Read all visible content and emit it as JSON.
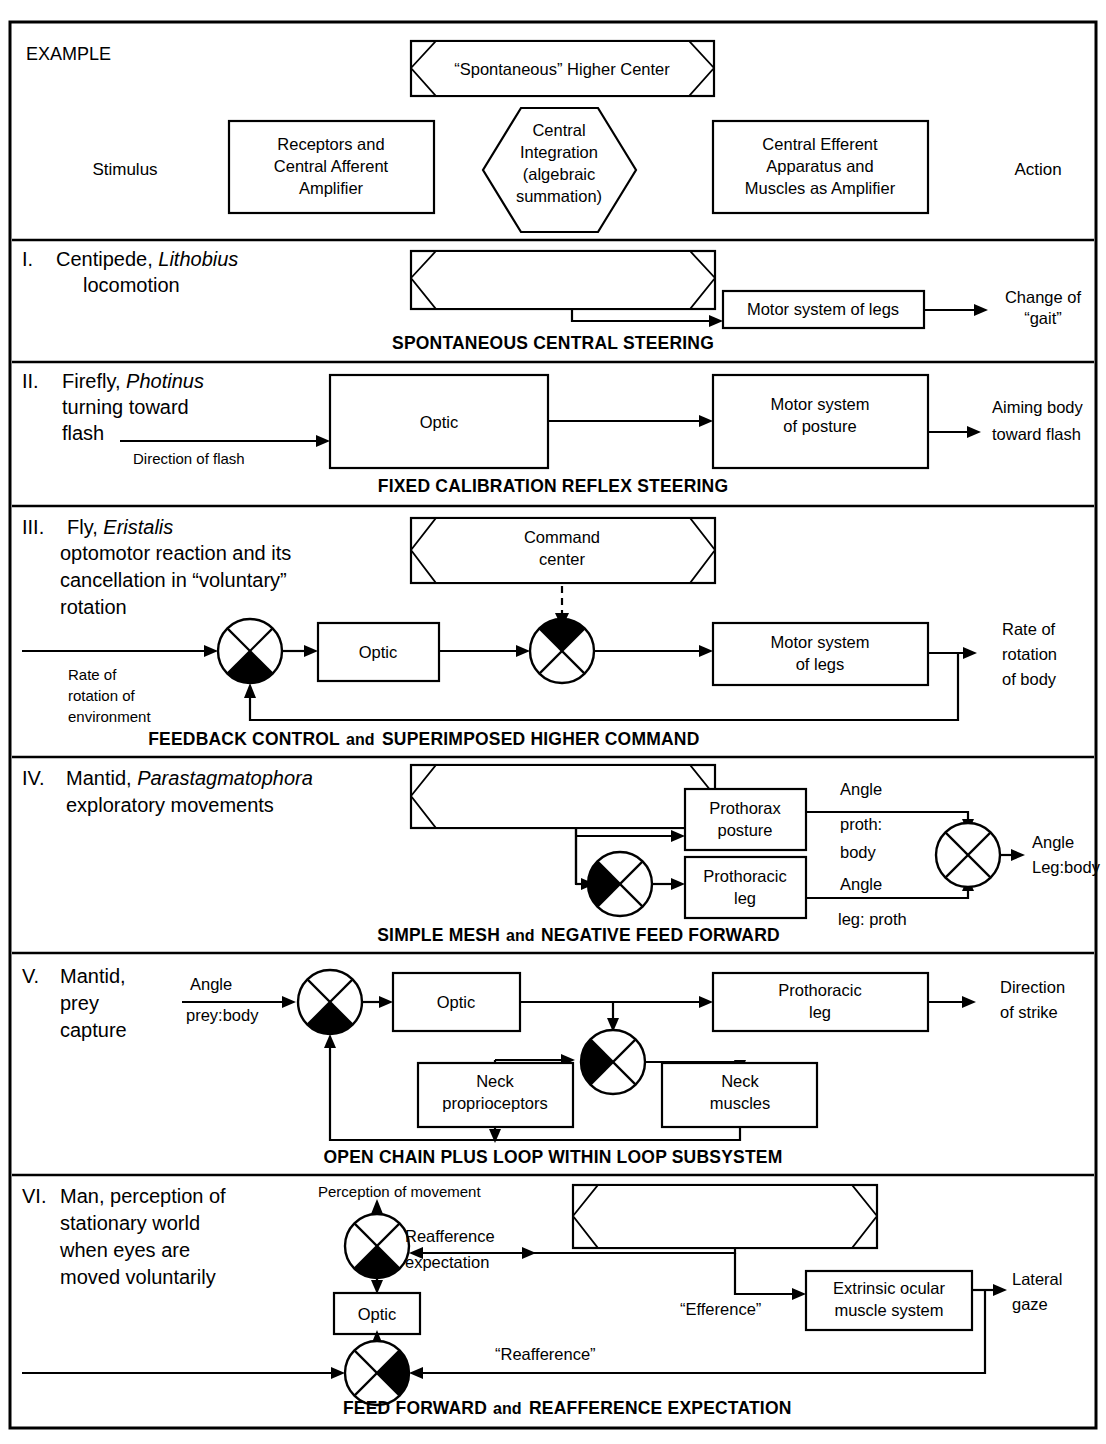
{
  "figure": {
    "header": {
      "example_label": "EXAMPLE",
      "spontaneous_box": "“Spontaneous” Higher Center",
      "stimulus_label": "Stimulus",
      "action_label": "Action",
      "receptors_box": [
        "Receptors and",
        "Central Afferent",
        "Amplifier"
      ],
      "central_integration_hex": [
        "Central",
        "Integration",
        "(algebraic",
        "summation)"
      ],
      "efferent_box": [
        "Central Efferent",
        "Apparatus and",
        "Muscles as Amplifier"
      ]
    },
    "rows": [
      {
        "numeral": "I.",
        "title_lines": [
          {
            "parts": [
              {
                "t": "Centipede, ",
                "i": false
              },
              {
                "t": "Lithobius",
                "i": true
              }
            ]
          },
          {
            "parts": [
              {
                "t": "locomotion",
                "i": false
              }
            ]
          }
        ],
        "caption": "SPONTANEOUS CENTRAL STEERING",
        "boxes": [
          {
            "name": "motor-system-of-legs",
            "label": "Motor system of legs"
          }
        ],
        "labels": [
          "Change of",
          "“gait”"
        ]
      },
      {
        "numeral": "II.",
        "title_lines": [
          {
            "parts": [
              {
                "t": "Firefly, ",
                "i": false
              },
              {
                "t": "Photinus",
                "i": true
              }
            ]
          },
          {
            "parts": [
              {
                "t": "turning toward",
                "i": false
              }
            ]
          },
          {
            "parts": [
              {
                "t": "flash",
                "i": false
              }
            ]
          }
        ],
        "caption": "FIXED CALIBRATION REFLEX STEERING",
        "boxes": [
          {
            "name": "optic",
            "label": "Optic"
          },
          {
            "name": "motor-system-of-posture",
            "label": [
              "Motor system",
              "of posture"
            ]
          }
        ],
        "labels": [
          "Direction of flash",
          "Aiming body",
          "toward flash"
        ]
      },
      {
        "numeral": "III.",
        "title_lines": [
          {
            "parts": [
              {
                "t": "Fly, ",
                "i": false
              },
              {
                "t": "Eristalis",
                "i": true
              }
            ]
          },
          {
            "parts": [
              {
                "t": "optomotor reaction and its",
                "i": false
              }
            ]
          },
          {
            "parts": [
              {
                "t": "cancellation in “voluntary”",
                "i": false
              }
            ]
          },
          {
            "parts": [
              {
                "t": "rotation",
                "i": false
              }
            ]
          }
        ],
        "caption_a": "FEEDBACK CONTROL",
        "caption_and": "and",
        "caption_b": "SUPERIMPOSED HIGHER COMMAND",
        "boxes": [
          {
            "name": "command-center",
            "label": [
              "Command",
              "center"
            ]
          },
          {
            "name": "optic",
            "label": "Optic"
          },
          {
            "name": "motor-system-of-legs",
            "label": [
              "Motor system",
              "of legs"
            ]
          }
        ],
        "labels": [
          "Rate of",
          "rotation of",
          "environment",
          "Rate of",
          "rotation",
          "of body"
        ]
      },
      {
        "numeral": "IV.",
        "title_lines": [
          {
            "parts": [
              {
                "t": "Mantid, ",
                "i": false
              },
              {
                "t": "Parastagmatophora",
                "i": true
              }
            ]
          },
          {
            "parts": [
              {
                "t": "exploratory movements",
                "i": false
              }
            ]
          }
        ],
        "caption_a": "SIMPLE MESH",
        "caption_and": "and",
        "caption_b": "NEGATIVE FEED FORWARD",
        "boxes": [
          {
            "name": "prothorax-posture",
            "label": [
              "Prothorax",
              "posture"
            ]
          },
          {
            "name": "prothoracic-leg",
            "label": [
              "Prothoracic",
              "leg"
            ]
          }
        ],
        "labels": [
          "Angle",
          "proth:",
          "body",
          "Angle",
          "leg: proth",
          "Angle",
          "Leg:body"
        ]
      },
      {
        "numeral": "V.",
        "title_lines": [
          {
            "parts": [
              {
                "t": "Mantid,",
                "i": false
              }
            ]
          },
          {
            "parts": [
              {
                "t": "prey",
                "i": false
              }
            ]
          },
          {
            "parts": [
              {
                "t": "capture",
                "i": false
              }
            ]
          }
        ],
        "caption": "OPEN CHAIN PLUS LOOP WITHIN LOOP SUBSYSTEM",
        "boxes": [
          {
            "name": "optic",
            "label": "Optic"
          },
          {
            "name": "prothoracic-leg",
            "label": [
              "Prothoracic",
              "leg"
            ]
          },
          {
            "name": "neck-proprioceptors",
            "label": [
              "Neck",
              "proprioceptors"
            ]
          },
          {
            "name": "neck-muscles",
            "label": [
              "Neck",
              "muscles"
            ]
          }
        ],
        "labels": [
          "Angle",
          "prey:body",
          "Direction",
          "of strike"
        ]
      },
      {
        "numeral": "VI.",
        "title_lines": [
          {
            "parts": [
              {
                "t": "Man, perception of",
                "i": false
              }
            ]
          },
          {
            "parts": [
              {
                "t": "stationary world",
                "i": false
              }
            ]
          },
          {
            "parts": [
              {
                "t": "when eyes are",
                "i": false
              }
            ]
          },
          {
            "parts": [
              {
                "t": "moved voluntarily",
                "i": false
              }
            ]
          }
        ],
        "caption_a": "FEED FORWARD",
        "caption_and": "and",
        "caption_b": "REAFFERENCE EXPECTATION",
        "boxes": [
          {
            "name": "optic",
            "label": "Optic"
          },
          {
            "name": "extrinsic-ocular-muscle-system",
            "label": [
              "Extrinsic ocular",
              "muscle system"
            ]
          }
        ],
        "labels": [
          "Perception of movement",
          "Reafference",
          "expectation",
          "“Efference”",
          "Lateral",
          "gaze",
          "“Reafference”"
        ]
      }
    ],
    "colors": {
      "ink": "#000000",
      "paper": "#ffffff"
    }
  }
}
